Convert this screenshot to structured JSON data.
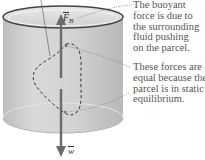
{
  "diagram": {
    "colors": {
      "cylinder_body": "#cfcfcf",
      "cylinder_top_rim": "#444444",
      "arrow": "#6b6b6b",
      "annotation_text": "#555555",
      "dashed_outline": "#333333",
      "leader_dotted": "#777777"
    },
    "labels": {
      "buoyant_force": {
        "symbol": "F",
        "subscript": "B"
      },
      "weight": {
        "symbol": "w"
      }
    },
    "annotations": {
      "buoyant": {
        "lines": [
          "The buoyant",
          "force is due to",
          "the surrounding",
          "fluid pushing",
          "on the parcel."
        ]
      },
      "equal": {
        "lines": [
          "These forces are",
          "equal because the",
          "parcel is in static",
          "equilibrium."
        ]
      }
    }
  }
}
